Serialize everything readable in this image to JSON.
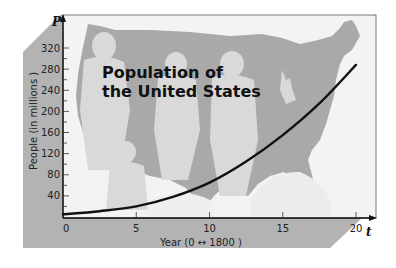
{
  "chart_data": {
    "type": "line",
    "title": "Population of the United States",
    "title_lines": [
      "Population of",
      "the United States"
    ],
    "xlabel": "Year (0 ↔ 1800 )",
    "ylabel": "People (in millions )",
    "x_variable": "t",
    "y_variable": "P",
    "xlim": [
      0,
      20
    ],
    "ylim": [
      0,
      320
    ],
    "x_ticks": [
      0,
      5,
      10,
      15,
      20
    ],
    "y_ticks": [
      40,
      80,
      120,
      160,
      200,
      240,
      280,
      320
    ],
    "grid": false,
    "legend": null,
    "series": [
      {
        "name": "US population",
        "x": [
          0,
          2.5,
          5,
          7.5,
          10,
          12.5,
          15,
          17.5,
          20
        ],
        "values": [
          5,
          11,
          20,
          38,
          65,
          105,
          155,
          215,
          288
        ]
      }
    ],
    "annotations": [
      "Background: silhouette map of the United States with people silhouettes"
    ]
  },
  "colors": {
    "frame_bg": "#b5b5b5",
    "plot_bg": "#f4f4f4",
    "map_fill": "#aaaaaa",
    "people_fill": "#d6d6d6",
    "curve": "#111111"
  }
}
